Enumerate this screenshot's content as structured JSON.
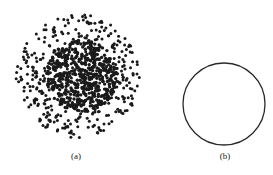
{
  "figure": {
    "panels": [
      {
        "id": "a",
        "label": "(a)",
        "description": "dense point cloud, denser core with sparser ring",
        "center": [
          78,
          76
        ],
        "radius": 62,
        "core_radius": 36,
        "dot_color": "#1a1a1a",
        "dot_count": 900
      },
      {
        "id": "b",
        "label": "(b)",
        "description": "circle outline",
        "center": [
          224,
          104
        ],
        "radius": 41,
        "stroke_color": "#2a2a2a"
      }
    ]
  }
}
